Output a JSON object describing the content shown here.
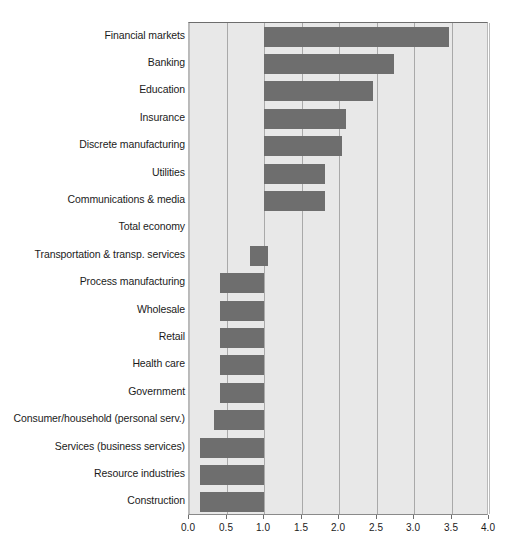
{
  "chart_data": {
    "type": "bar",
    "orientation": "horizontal",
    "title": "",
    "subtitle": "",
    "xlabel": "",
    "ylabel": "",
    "xlim": [
      0.0,
      4.0
    ],
    "xticks": [
      "0.0",
      "0.5",
      "1.0",
      "1.5",
      "2.0",
      "2.5",
      "3.0",
      "3.5",
      "4.0"
    ],
    "xtick_values": [
      0.0,
      0.5,
      1.0,
      1.5,
      2.0,
      2.5,
      3.0,
      3.5,
      4.0
    ],
    "grid": true,
    "grid_axis": "x",
    "baseline": 1.0,
    "legend": null,
    "bar_color": "#6e6e6e",
    "plot_background": "#e8e8e8",
    "gridline_color": "#a9a9a9",
    "categories": [
      "Financial markets",
      "Banking",
      "Education",
      "Insurance",
      "Discrete manufacturing",
      "Utilities",
      "Communications & media",
      "Total economy",
      "Transportation & transp. services",
      "Process manufacturing",
      "Wholesale",
      "Retail",
      "Health care",
      "Government",
      "Consumer/household (personal serv.)",
      "Services (business services)",
      "Resource industries",
      "Construction"
    ],
    "values": [
      3.47,
      2.73,
      2.45,
      2.09,
      2.04,
      1.81,
      1.81,
      1.0,
      0.81,
      0.41,
      0.41,
      0.41,
      0.41,
      0.41,
      0.33,
      0.15,
      0.15,
      0.15
    ],
    "bar_spans": [
      {
        "category": "Financial markets",
        "start": 1.0,
        "end": 3.47
      },
      {
        "category": "Banking",
        "start": 1.0,
        "end": 2.73
      },
      {
        "category": "Education",
        "start": 1.0,
        "end": 2.45
      },
      {
        "category": "Insurance",
        "start": 1.0,
        "end": 2.09
      },
      {
        "category": "Discrete manufacturing",
        "start": 1.0,
        "end": 2.04
      },
      {
        "category": "Utilities",
        "start": 1.0,
        "end": 1.81
      },
      {
        "category": "Communications & media",
        "start": 1.0,
        "end": 1.81
      },
      {
        "category": "Total economy",
        "start": 1.0,
        "end": 1.0
      },
      {
        "category": "Transportation & transp. services",
        "start": 0.81,
        "end": 1.05
      },
      {
        "category": "Process manufacturing",
        "start": 0.41,
        "end": 1.0
      },
      {
        "category": "Wholesale",
        "start": 0.41,
        "end": 1.0
      },
      {
        "category": "Retail",
        "start": 0.41,
        "end": 1.0
      },
      {
        "category": "Health care",
        "start": 0.41,
        "end": 1.0
      },
      {
        "category": "Government",
        "start": 0.41,
        "end": 1.0
      },
      {
        "category": "Consumer/household (personal serv.)",
        "start": 0.33,
        "end": 1.0
      },
      {
        "category": "Services (business services)",
        "start": 0.15,
        "end": 1.0
      },
      {
        "category": "Resource industries",
        "start": 0.15,
        "end": 1.0
      },
      {
        "category": "Construction",
        "start": 0.15,
        "end": 1.0
      }
    ]
  }
}
